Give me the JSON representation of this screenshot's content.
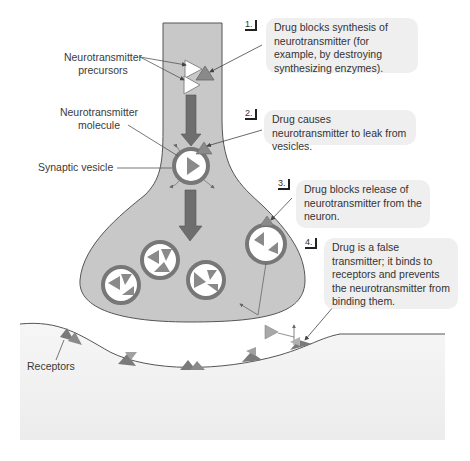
{
  "figure": {
    "colors": {
      "neuron_fill": "#c8c8c8",
      "neuron_stroke": "#555555",
      "arrow_dark": "#6e6e6e",
      "molecule_dark": "#8a8a8a",
      "molecule_light": "#ffffff",
      "postsynaptic_fill": "#f1f1f1",
      "callout_bg": "#efefef"
    }
  },
  "labels": {
    "precursors": "Neurotransmitter precursors",
    "precursors_line1": "Neurotransmitter",
    "precursors_line2": "precursors",
    "molecule": "Neurotransmitter molecule",
    "molecule_line1": "Neurotransmitter",
    "molecule_line2": "molecule",
    "vesicle": "Synaptic vesicle",
    "receptors": "Receptors"
  },
  "callouts": [
    {
      "number": "1.",
      "text": "Drug blocks synthesis of neurotransmitter (for example, by destroying synthesizing enzymes)."
    },
    {
      "number": "2.",
      "text": "Drug causes neurotransmitter to leak from vesicles."
    },
    {
      "number": "3.",
      "text": "Drug blocks release of neurotransmitter from the neuron."
    },
    {
      "number": "4.",
      "text": "Drug is a false transmitter; it binds to receptors and prevents the neurotransmitter from binding them."
    }
  ]
}
